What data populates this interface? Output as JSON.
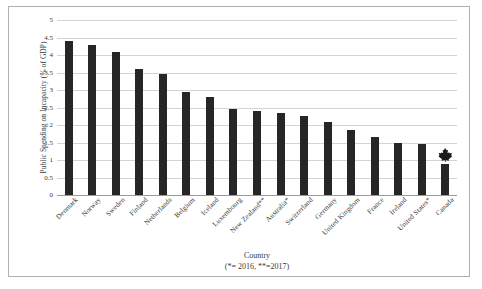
{
  "chart_data": {
    "type": "bar",
    "title": "",
    "xlabel": "Country",
    "xlabel_note": "(*= 2016, **=2017)",
    "ylabel": "Public Spending on Incapacity (% of GDP)",
    "ylim": [
      0,
      5
    ],
    "ytick_step": 0.5,
    "yticks": [
      "0",
      "0.5",
      "1",
      "1.5",
      "2",
      "2.5",
      "3",
      "3.5",
      "4",
      "4.5",
      "5"
    ],
    "grid": true,
    "legend": "none",
    "bar_color": "#262626",
    "gridline_color": "#d4d4d4",
    "categories": [
      "Denmark",
      "Norway",
      "Sweden",
      "Finland",
      "Netherlands",
      "Belgium",
      "Iceland",
      "Luxembourg",
      "New Zealand**",
      "Australia*",
      "Switzerland",
      "Germany",
      "United Kingdom",
      "France",
      "Ireland",
      "United States*",
      "Canada"
    ],
    "values": [
      4.4,
      4.3,
      4.1,
      3.6,
      3.45,
      2.95,
      2.8,
      2.45,
      2.4,
      2.35,
      2.25,
      2.1,
      1.85,
      1.65,
      1.5,
      1.45,
      0.9
    ],
    "annotations": [
      {
        "target": "Canada",
        "icon": "maple-leaf-icon",
        "color": "#1a1a1a"
      }
    ]
  }
}
